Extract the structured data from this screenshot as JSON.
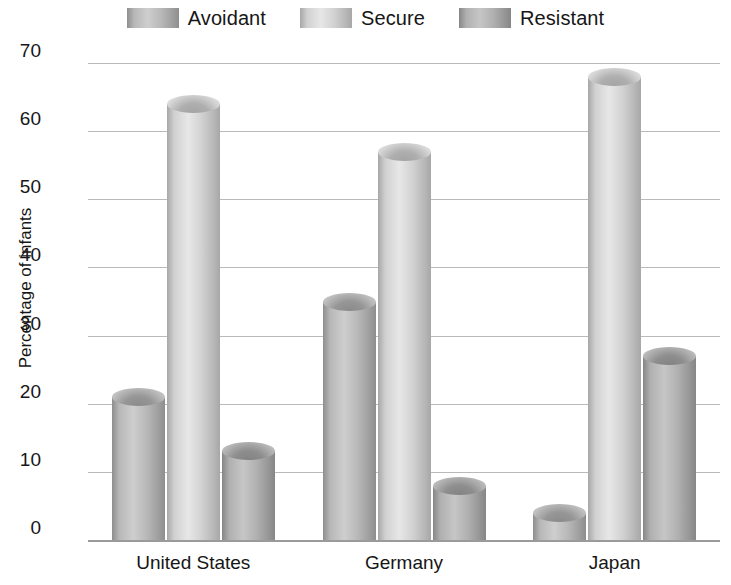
{
  "chart_data": {
    "type": "bar",
    "title": "",
    "xlabel": "",
    "ylabel": "Percentage of infants",
    "ylim": [
      0,
      70
    ],
    "ytick_step": 10,
    "yticks": [
      70,
      60,
      50,
      40,
      30,
      20,
      10,
      0
    ],
    "grid": true,
    "legend_position": "top-center",
    "categories": [
      "United States",
      "Germany",
      "Japan"
    ],
    "series": [
      {
        "name": "Avoidant",
        "values": [
          21,
          35,
          4
        ]
      },
      {
        "name": "Secure",
        "values": [
          64,
          57,
          68
        ]
      },
      {
        "name": "Resistant",
        "values": [
          13,
          8,
          27
        ]
      }
    ],
    "style": {
      "bar_shape": "cylinder",
      "background": "#ffffff",
      "gridline_color": "#b9b9b9",
      "baseline_color": "#9a9a9a",
      "text_color": "#161616",
      "series_colors": [
        "#b0b0b0",
        "#c9c9c9",
        "#a8a8a8"
      ]
    }
  }
}
